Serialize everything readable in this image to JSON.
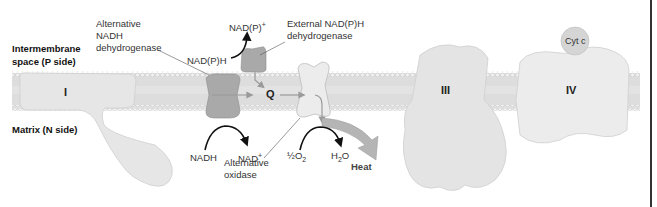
{
  "regions": {
    "intermembrane_line1": "Intermembrane",
    "intermembrane_line2": "space (P side)",
    "matrix": "Matrix (N side)"
  },
  "complexes": {
    "I": "I",
    "Q": "Q",
    "III": "III",
    "IV": "IV",
    "cytc": "Cyt c"
  },
  "labels": {
    "alt_nadh_line1": "Alternative",
    "alt_nadh_line2": "NADH",
    "alt_nadh_line3": "dehydrogenase",
    "ext_nadph_line1": "External NAD(P)H",
    "ext_nadph_line2": "dehydrogenase",
    "nadp_plus": "NAD(P)",
    "nadp_plus_sup": "+",
    "nadph": "NAD(P)H",
    "nadh": "NADH",
    "nad_plus": "NAD",
    "nad_plus_sup": "+",
    "half_o2": "½O",
    "half_o2_sub": "2",
    "h2o_h": "H",
    "h2o_sub": "2",
    "h2o_o": "O",
    "alt_oxidase_line1": "Alternative",
    "alt_oxidase_line2": "oxidase",
    "heat": "Heat"
  },
  "colors": {
    "membrane": "#e3e3e3",
    "protein_light": "#e6e6e6",
    "protein_dark": "#a9a9a9",
    "arrow_black": "#111111",
    "arrow_gray": "#9a9a9a",
    "heat_arrow": "#b5b5b5"
  }
}
